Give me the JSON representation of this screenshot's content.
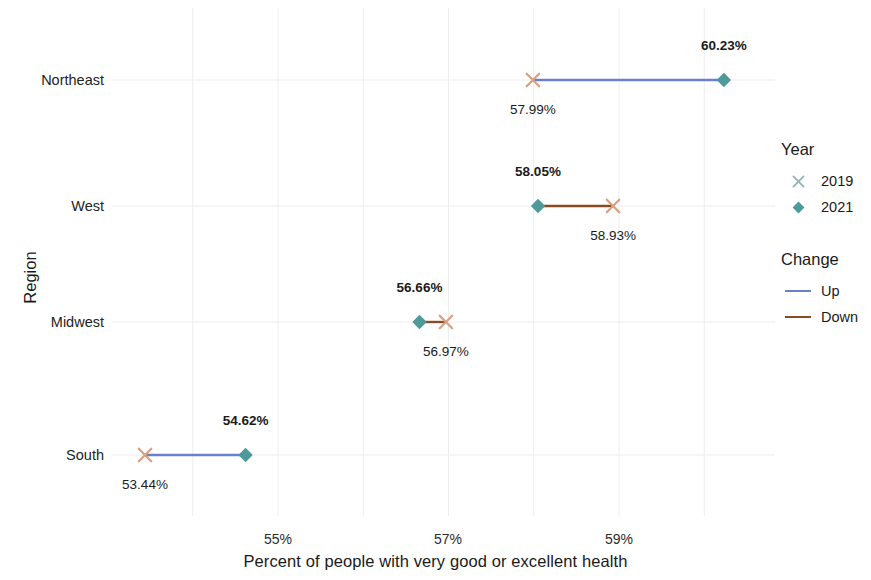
{
  "chart_data": {
    "type": "dumbbell",
    "title": "",
    "xlabel": "Percent of people with very good or excellent health",
    "ylabel": "Region",
    "categories": [
      "Northeast",
      "West",
      "Midwest",
      "South"
    ],
    "xlim": [
      53.0,
      60.9
    ],
    "xticks": [
      55,
      57,
      59
    ],
    "xticklabels": [
      "55%",
      "57%",
      "59%"
    ],
    "grid": true,
    "legend_position": "right",
    "series": [
      {
        "name": "2019",
        "marker": "x",
        "color": "#d9a184",
        "legend_color": "#8fb2b0",
        "values": [
          57.99,
          58.93,
          56.97,
          53.44
        ],
        "labels": [
          "57.99%",
          "58.93%",
          "56.97%",
          "53.44%"
        ]
      },
      {
        "name": "2021",
        "marker": "diamond",
        "color": "#4e9a9a",
        "legend_color": "#4e9a9a",
        "values": [
          60.23,
          58.05,
          56.66,
          54.62
        ],
        "labels": [
          "60.23%",
          "58.05%",
          "56.66%",
          "54.62%"
        ]
      }
    ],
    "changes": [
      "Up",
      "Down",
      "Down",
      "Up"
    ],
    "change_colors": {
      "Up": "#6b7fd0",
      "Down": "#8a4a22"
    }
  },
  "axes": {
    "y_title": "Region",
    "x_title": "Percent of people with very good or excellent health",
    "categories": [
      {
        "label": "Northeast"
      },
      {
        "label": "West"
      },
      {
        "label": "Midwest"
      },
      {
        "label": "South"
      }
    ],
    "xticks": [
      {
        "label": "55%"
      },
      {
        "label": "57%"
      },
      {
        "label": "59%"
      }
    ]
  },
  "rows": [
    {
      "region": "Northeast",
      "year2019_value": "57.99%",
      "year2021_value": "60.23%",
      "change": "Up"
    },
    {
      "region": "West",
      "year2019_value": "58.93%",
      "year2021_value": "58.05%",
      "change": "Down"
    },
    {
      "region": "Midwest",
      "year2019_value": "56.97%",
      "year2021_value": "56.66%",
      "change": "Down"
    },
    {
      "region": "South",
      "year2019_value": "53.44%",
      "year2021_value": "54.62%",
      "change": "Up"
    }
  ],
  "legend": {
    "year": {
      "title": "Year",
      "items": [
        {
          "label": "2019",
          "marker": "x-marker"
        },
        {
          "label": "2021",
          "marker": "diamond-marker"
        }
      ]
    },
    "change": {
      "title": "Change",
      "items": [
        {
          "label": "Up",
          "marker": "line-up"
        },
        {
          "label": "Down",
          "marker": "line-down"
        }
      ]
    }
  }
}
